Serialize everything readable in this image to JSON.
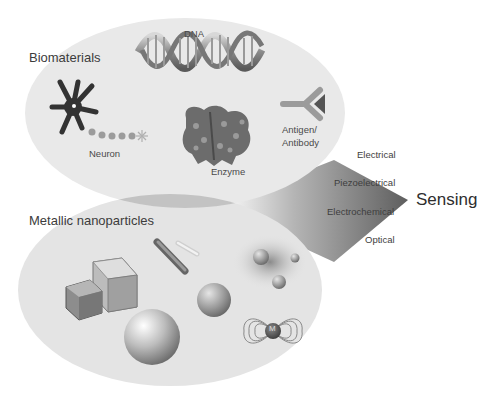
{
  "diagram": {
    "groups": [
      {
        "title": "Biomaterials",
        "items": [
          {
            "label": "DNA",
            "icon": "dna-helix-icon"
          },
          {
            "label": "Neuron",
            "icon": "neuron-icon"
          },
          {
            "label": "Enzyme",
            "icon": "enzyme-protein-icon"
          },
          {
            "label": "Antigen/",
            "label2": "Antibody",
            "icon": "antibody-icon"
          }
        ]
      },
      {
        "title": "Metallic nanoparticles",
        "items": [
          {
            "label": "",
            "icon": "nanocube-icon"
          },
          {
            "label": "",
            "icon": "nanorod-icon"
          },
          {
            "label": "",
            "icon": "nanosphere-icon"
          },
          {
            "label": "",
            "icon": "plasmonic-particles-icon"
          },
          {
            "label": "M",
            "icon": "magnetic-particle-icon"
          }
        ]
      }
    ],
    "sensing_modes": [
      "Electrical",
      "Piezoelectrical",
      "Electrochemical",
      "Optical"
    ],
    "output": "Sensing",
    "colors": {
      "ellipse_fill": "#e6e6e6",
      "overlap_fill": "#c4c4c4",
      "funnel_dark": "#6e6e6e",
      "funnel_light": "#e8e8e8",
      "text": "#3c3c3c"
    }
  }
}
